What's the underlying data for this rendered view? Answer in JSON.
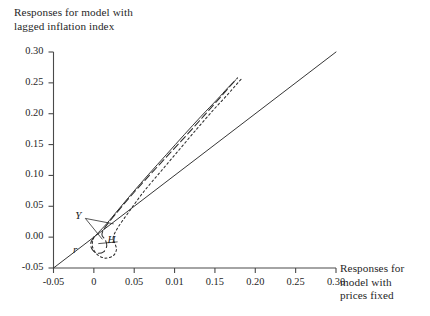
{
  "chart_data": {
    "type": "line",
    "title": "",
    "xlabel": "Responses for model with prices fixed",
    "ylabel": "Responses for model with lagged inflation index",
    "xlim": [
      -0.075,
      0.315
    ],
    "ylim": [
      -0.065,
      0.315
    ],
    "grid": false,
    "legend": "none",
    "xticks": [
      "-0.05",
      "0",
      "0.05",
      "0.01",
      "0.15",
      "0.20",
      "0.25",
      "0.30"
    ],
    "xtick_values": [
      -0.05,
      0,
      0.05,
      0.1,
      0.15,
      0.2,
      0.25,
      0.3
    ],
    "yticks": [
      "-0.05",
      "0.00",
      "0.05",
      "0.10",
      "0.15",
      "0.20",
      "0.25",
      "0.30"
    ],
    "ytick_values": [
      -0.05,
      0,
      0.05,
      0.1,
      0.15,
      0.2,
      0.25,
      0.3
    ],
    "annotations": [
      {
        "text": "Y",
        "x": -0.018,
        "y": 0.032
      },
      {
        "text": "H",
        "x": 0.022,
        "y": -0.006
      },
      {
        "text": "r",
        "x": -0.021,
        "y": -0.022
      }
    ],
    "series": [
      {
        "name": "45-degree-reference-line",
        "style": "solid",
        "points": [
          [
            -0.05,
            -0.05
          ],
          [
            0.3,
            0.3
          ]
        ]
      },
      {
        "name": "Y",
        "style": "dashed",
        "points": [
          [
            0.0,
            0.0
          ],
          [
            -0.004,
            -0.01
          ],
          [
            -0.002,
            -0.02
          ],
          [
            0.004,
            -0.026
          ],
          [
            0.012,
            -0.024
          ],
          [
            0.016,
            -0.014
          ],
          [
            0.014,
            -0.004
          ],
          [
            0.01,
            0.004
          ],
          [
            0.014,
            0.016
          ],
          [
            0.026,
            0.036
          ],
          [
            0.044,
            0.064
          ],
          [
            0.066,
            0.096
          ],
          [
            0.09,
            0.13
          ],
          [
            0.114,
            0.164
          ],
          [
            0.136,
            0.196
          ],
          [
            0.155,
            0.224
          ],
          [
            0.169,
            0.245
          ],
          [
            0.178,
            0.258
          ]
        ]
      },
      {
        "name": "H",
        "style": "dotted",
        "points": [
          [
            0.0,
            0.0
          ],
          [
            -0.002,
            -0.014
          ],
          [
            0.004,
            -0.028
          ],
          [
            0.014,
            -0.034
          ],
          [
            0.024,
            -0.03
          ],
          [
            0.028,
            -0.02
          ],
          [
            0.026,
            -0.01
          ],
          [
            0.024,
            0.0
          ],
          [
            0.03,
            0.016
          ],
          [
            0.044,
            0.042
          ],
          [
            0.062,
            0.074
          ],
          [
            0.084,
            0.108
          ],
          [
            0.106,
            0.142
          ],
          [
            0.128,
            0.176
          ],
          [
            0.148,
            0.206
          ],
          [
            0.165,
            0.23
          ],
          [
            0.177,
            0.248
          ],
          [
            0.184,
            0.258
          ]
        ]
      },
      {
        "name": "r",
        "style": "solid-thin",
        "points": [
          [
            0.0,
            0.0
          ],
          [
            0.006,
            0.008
          ],
          [
            0.016,
            0.022
          ],
          [
            0.03,
            0.044
          ],
          [
            0.048,
            0.072
          ],
          [
            0.068,
            0.102
          ],
          [
            0.09,
            0.134
          ],
          [
            0.112,
            0.166
          ],
          [
            0.133,
            0.196
          ],
          [
            0.152,
            0.222
          ],
          [
            0.166,
            0.242
          ],
          [
            0.176,
            0.255
          ]
        ]
      }
    ]
  },
  "axes": {
    "y_title": "Responses for model with\nlagged inflation index",
    "x_title": "Responses for\nmodel with\nprices fixed"
  },
  "labels": {
    "y_curve": "Y",
    "h_curve": "H",
    "r_curve": "r"
  }
}
